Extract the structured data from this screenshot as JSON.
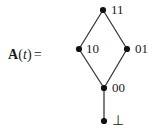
{
  "figure": {
    "caption_label": {
      "function_name": "A",
      "open_paren": "(",
      "variable": "t",
      "close_paren": ")",
      "equals": "="
    },
    "diagram_type": "hasse-lattice",
    "line_color": "#3a3a3a",
    "node_color": "#111111",
    "background_color": "#ffffff",
    "nodes": [
      {
        "id": "top",
        "label": "11",
        "x": 103,
        "y": 10,
        "label_position": "upper-right"
      },
      {
        "id": "left",
        "label": "10",
        "x": 79,
        "y": 49,
        "label_position": "right"
      },
      {
        "id": "right",
        "label": "01",
        "x": 127,
        "y": 49,
        "label_position": "right"
      },
      {
        "id": "middle",
        "label": "00",
        "x": 104,
        "y": 88,
        "label_position": "right"
      },
      {
        "id": "bottom",
        "label": "⊥",
        "x": 104,
        "y": 121,
        "label_position": "right"
      }
    ],
    "edges": [
      {
        "from": "left",
        "to": "top"
      },
      {
        "from": "right",
        "to": "top"
      },
      {
        "from": "middle",
        "to": "left"
      },
      {
        "from": "middle",
        "to": "right"
      },
      {
        "from": "bottom",
        "to": "middle"
      }
    ]
  }
}
